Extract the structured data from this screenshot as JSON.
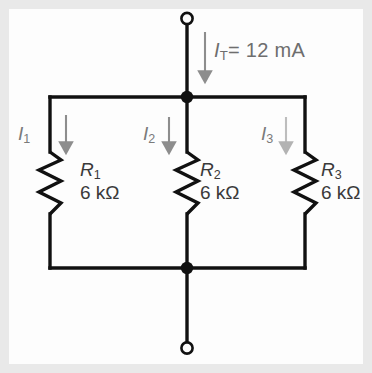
{
  "figure": {
    "type": "parallel-resistor-circuit-diagram",
    "background_color": "#fdfdfd",
    "frame_color": "#e9e9e9",
    "wire_color": "#000000",
    "label_gray": "#6e6e6e",
    "resistor_label_color": "#3a3a3a"
  },
  "source": {
    "total_current_label": "I",
    "total_current_subscript": "T",
    "total_current_equals": "= 12 mA",
    "total_current_value": "12 mA",
    "arrow_name": "total-current-arrow"
  },
  "branches": [
    {
      "current_symbol": "I",
      "current_subscript": "1",
      "resistor_name": "R",
      "resistor_subscript": "1",
      "resistance": "6 kΩ"
    },
    {
      "current_symbol": "I",
      "current_subscript": "2",
      "resistor_name": "R",
      "resistor_subscript": "2",
      "resistance": "6 kΩ"
    },
    {
      "current_symbol": "I",
      "current_subscript": "3",
      "resistor_name": "R",
      "resistor_subscript": "3",
      "resistance": "6 kΩ"
    }
  ],
  "terminals": {
    "top_terminal": "open-circle",
    "bottom_terminal": "open-circle"
  },
  "nodes": {
    "top_junction": "solid-dot",
    "bottom_junction": "solid-dot"
  }
}
